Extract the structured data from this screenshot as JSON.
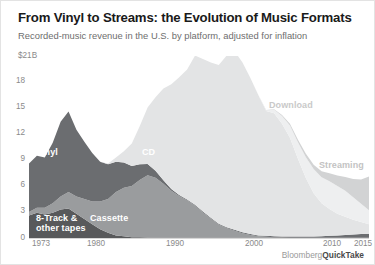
{
  "header": {
    "title": "From Vinyl to Streams: the Evolution of Music Formats",
    "subtitle": "Recorded-music revenue in the U.S. by platform, adjusted for inflation"
  },
  "footer": {
    "brand": "Bloomberg",
    "product": "QuickTake"
  },
  "chart_data": {
    "type": "area",
    "stacked": true,
    "title": "From Vinyl to Streams: the Evolution of Music Formats",
    "subtitle": "Recorded-music revenue in the U.S. by platform, adjusted for inflation",
    "xlabel": "",
    "ylabel": "",
    "unit_label": "$21B",
    "ylim": [
      0,
      21
    ],
    "xlim": [
      1973,
      2016
    ],
    "grid": false,
    "legend_position": "inline-annotations",
    "ytick_labels": [
      "$21B",
      "18",
      "15",
      "12",
      "9",
      "6",
      "3",
      "0"
    ],
    "ytick_values": [
      21,
      18,
      15,
      12,
      9,
      6,
      3,
      0
    ],
    "xtick_labels": [
      "1973",
      "1980",
      "1990",
      "2000",
      "2010",
      "2015"
    ],
    "xtick_values": [
      1973,
      1980,
      1990,
      2000,
      2010,
      2015
    ],
    "x": [
      1973,
      1974,
      1975,
      1976,
      1977,
      1978,
      1979,
      1980,
      1981,
      1982,
      1983,
      1984,
      1985,
      1986,
      1987,
      1988,
      1989,
      1990,
      1991,
      1992,
      1993,
      1994,
      1995,
      1996,
      1997,
      1998,
      1999,
      2000,
      2001,
      2002,
      2003,
      2004,
      2005,
      2006,
      2007,
      2008,
      2009,
      2010,
      2011,
      2012,
      2013,
      2014,
      2015,
      2016
    ],
    "series": [
      {
        "name": "8-Track & other tapes",
        "color": "#58595b",
        "values": [
          2.6,
          2.9,
          2.7,
          2.9,
          3.3,
          3.4,
          2.8,
          2.2,
          1.6,
          1.0,
          0.6,
          0.3,
          0.2,
          0.1,
          0.1,
          0.05,
          0.05,
          0.05,
          0.05,
          0.05,
          0.05,
          0.05,
          0.05,
          0.05,
          0.05,
          0.05,
          0.05,
          0.05,
          0.05,
          0.05,
          0.05,
          0.05,
          0.05,
          0.05,
          0.05,
          0.05,
          0.05,
          0.05,
          0.05,
          0.05,
          0.05,
          0.05,
          0.05,
          0.05
        ]
      },
      {
        "name": "Cassette",
        "color": "#9a9c9e",
        "values": [
          0.4,
          0.6,
          0.8,
          1.1,
          1.5,
          1.9,
          2.0,
          2.3,
          2.6,
          3.2,
          3.9,
          5.0,
          5.6,
          5.9,
          6.6,
          7.2,
          6.9,
          6.2,
          5.4,
          4.8,
          4.3,
          3.7,
          2.9,
          2.2,
          1.5,
          1.1,
          0.8,
          0.5,
          0.3,
          0.15,
          0.1,
          0.05,
          0.03,
          0.02,
          0.02,
          0.01,
          0.01,
          0.01,
          0.01,
          0.0,
          0.0,
          0.0,
          0.0,
          0.0
        ]
      },
      {
        "name": "Vinyl",
        "color": "#6b6d70",
        "values": [
          5.6,
          6.0,
          5.8,
          7.0,
          8.6,
          9.3,
          7.7,
          6.6,
          5.6,
          4.6,
          4.0,
          3.5,
          2.9,
          2.3,
          1.8,
          1.3,
          0.8,
          0.4,
          0.2,
          0.1,
          0.1,
          0.1,
          0.1,
          0.1,
          0.1,
          0.1,
          0.1,
          0.1,
          0.1,
          0.1,
          0.1,
          0.1,
          0.1,
          0.1,
          0.1,
          0.1,
          0.1,
          0.15,
          0.2,
          0.25,
          0.3,
          0.35,
          0.4,
          0.45
        ]
      },
      {
        "name": "CD",
        "color": "#e3e4e5",
        "values": [
          0,
          0,
          0,
          0,
          0,
          0,
          0,
          0,
          0,
          0,
          0.1,
          0.5,
          1.3,
          2.6,
          4.4,
          6.5,
          8.5,
          10.6,
          12.1,
          13.6,
          15.0,
          17.2,
          17.6,
          17.9,
          18.3,
          19.8,
          20.6,
          19.6,
          18.0,
          16.2,
          14.4,
          14.2,
          13.0,
          11.4,
          9.0,
          6.8,
          5.0,
          3.8,
          3.1,
          2.5,
          2.1,
          1.7,
          1.4,
          1.1
        ]
      },
      {
        "name": "Download",
        "color": "#eeeff0",
        "values": [
          0,
          0,
          0,
          0,
          0,
          0,
          0,
          0,
          0,
          0,
          0,
          0,
          0,
          0,
          0,
          0,
          0,
          0,
          0,
          0,
          0,
          0,
          0,
          0,
          0,
          0,
          0,
          0,
          0,
          0.02,
          0.1,
          0.4,
          0.9,
          1.4,
          1.9,
          2.4,
          2.8,
          3.0,
          3.2,
          3.2,
          3.0,
          2.6,
          2.1,
          1.6
        ]
      },
      {
        "name": "Streaming",
        "color": "#d2d3d4",
        "values": [
          0,
          0,
          0,
          0,
          0,
          0,
          0,
          0,
          0,
          0,
          0,
          0,
          0,
          0,
          0,
          0,
          0,
          0,
          0,
          0,
          0,
          0,
          0,
          0,
          0,
          0,
          0,
          0,
          0,
          0,
          0.02,
          0.05,
          0.1,
          0.2,
          0.3,
          0.4,
          0.5,
          0.7,
          0.9,
          1.2,
          1.6,
          2.1,
          2.8,
          3.9
        ]
      }
    ],
    "annotations": [
      {
        "text": "Vinyl",
        "series": "Vinyl",
        "color": "#ffffff"
      },
      {
        "text": "8-Track &",
        "series": "8-Track & other tapes",
        "color": "#ffffff"
      },
      {
        "text": "other tapes",
        "series": "8-Track & other tapes",
        "color": "#ffffff"
      },
      {
        "text": "Cassette",
        "series": "Cassette",
        "color": "#ffffff"
      },
      {
        "text": "CD",
        "series": "CD",
        "color": "#ffffff"
      },
      {
        "text": "Download",
        "series": "Download",
        "color": "#c9c9c9"
      },
      {
        "text": "Streaming",
        "series": "Streaming",
        "color": "#c3c3c3"
      }
    ]
  }
}
